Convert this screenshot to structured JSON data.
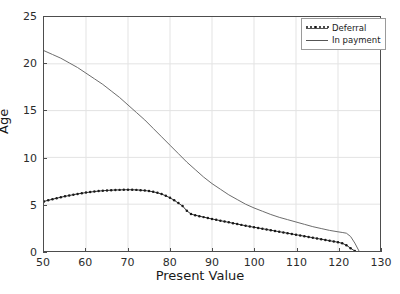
{
  "chart_data": {
    "type": "line",
    "title": "",
    "xlabel": "Present Value",
    "ylabel": "Age",
    "xlim": [
      50,
      130
    ],
    "ylim": [
      0,
      25
    ],
    "xticks": [
      50,
      60,
      70,
      80,
      90,
      100,
      110,
      120,
      130
    ],
    "yticks": [
      0,
      5,
      10,
      15,
      20,
      25
    ],
    "grid": true,
    "legend_position": "upper right",
    "colors": {
      "deferral": "#1a1a1a",
      "in_payment": "#6b6b6b",
      "grid": "#e3e3e3",
      "frame": "#4d4d4d",
      "background": "#ffffff"
    },
    "series": [
      {
        "name": "Deferral",
        "style": "line-with-dot-markers",
        "x": [
          50,
          51,
          52,
          53,
          54,
          55,
          56,
          57,
          58,
          59,
          60,
          61,
          62,
          63,
          64,
          65,
          66,
          67,
          68,
          69,
          70,
          71,
          72,
          73,
          74,
          75,
          76,
          77,
          78,
          79,
          80,
          81,
          82,
          83,
          84,
          85,
          86,
          87,
          88,
          89,
          90,
          91,
          92,
          93,
          94,
          95,
          96,
          97,
          98,
          99,
          100,
          101,
          102,
          103,
          104,
          105,
          106,
          107,
          108,
          109,
          110,
          111,
          112,
          113,
          114,
          115,
          116,
          117,
          118,
          119,
          120,
          121,
          122,
          123,
          124
        ],
        "y": [
          5.3,
          5.42,
          5.53,
          5.64,
          5.74,
          5.84,
          5.93,
          6.02,
          6.1,
          6.17,
          6.24,
          6.3,
          6.35,
          6.4,
          6.44,
          6.47,
          6.5,
          6.52,
          6.53,
          6.54,
          6.55,
          6.54,
          6.53,
          6.5,
          6.46,
          6.4,
          6.32,
          6.22,
          6.08,
          5.9,
          5.68,
          5.42,
          5.12,
          4.8,
          4.3,
          3.95,
          3.82,
          3.72,
          3.62,
          3.52,
          3.42,
          3.33,
          3.24,
          3.15,
          3.06,
          2.97,
          2.88,
          2.79,
          2.7,
          2.62,
          2.54,
          2.46,
          2.38,
          2.3,
          2.22,
          2.14,
          2.06,
          1.98,
          1.9,
          1.82,
          1.74,
          1.66,
          1.58,
          1.5,
          1.42,
          1.34,
          1.26,
          1.18,
          1.1,
          1.02,
          0.94,
          0.82,
          0.62,
          0.3,
          0.0
        ]
      },
      {
        "name": "In payment",
        "style": "line",
        "x": [
          50,
          52,
          54,
          56,
          58,
          60,
          62,
          64,
          66,
          68,
          70,
          72,
          74,
          76,
          78,
          80,
          82,
          84,
          86,
          88,
          90,
          92,
          94,
          96,
          98,
          100,
          102,
          104,
          106,
          108,
          110,
          112,
          114,
          116,
          118,
          120,
          121,
          122,
          123,
          124,
          125
        ],
        "y": [
          21.4,
          21.0,
          20.6,
          20.1,
          19.6,
          19.0,
          18.4,
          17.8,
          17.1,
          16.4,
          15.6,
          14.8,
          14.0,
          13.1,
          12.2,
          11.3,
          10.4,
          9.5,
          8.7,
          7.9,
          7.2,
          6.6,
          6.0,
          5.5,
          5.0,
          4.6,
          4.25,
          3.9,
          3.6,
          3.35,
          3.1,
          2.85,
          2.6,
          2.4,
          2.2,
          2.05,
          1.98,
          1.9,
          1.55,
          0.85,
          0.0
        ]
      }
    ]
  },
  "legend": {
    "items": [
      {
        "label": "Deferral"
      },
      {
        "label": "In payment"
      }
    ]
  }
}
